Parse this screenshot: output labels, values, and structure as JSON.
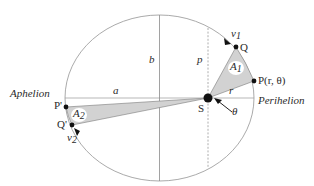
{
  "diagram": {
    "labels": {
      "aphelion": "Aphelion",
      "perihelion": "Perihelion",
      "semi_major": "a",
      "semi_minor": "b",
      "semi_latus_rectum": "p",
      "radius": "r",
      "angle": "θ",
      "sun": "S",
      "point_P": "P(r, θ)",
      "point_Q": "Q",
      "point_P_prime": "P'",
      "point_Q_prime": "Q'",
      "velocity_1": "v",
      "velocity_1_sub": "1",
      "velocity_2": "v",
      "velocity_2_sub": "2",
      "area_1": "A",
      "area_1_sub": "1",
      "area_2": "A",
      "area_2_sub": "2"
    },
    "colors": {
      "ellipse": "#9a9a9a",
      "axes": "#8a8a8a",
      "sector_fill": "#d4d4d4",
      "sector_stroke": "#7a7a7a",
      "points": "#111111",
      "text": "#2a2a2a"
    }
  }
}
